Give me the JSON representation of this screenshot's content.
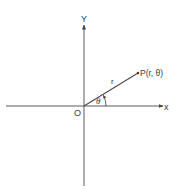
{
  "diagram": {
    "colors": {
      "line": "#555555",
      "text": "#3a3a3a",
      "background": "#ffffff"
    },
    "axes": {
      "x_label": "x",
      "y_label": "Y",
      "origin_label": "O"
    },
    "ray": {
      "length_label": "r",
      "angle_label": "θ"
    },
    "point": {
      "label": "P(r, θ)"
    }
  }
}
